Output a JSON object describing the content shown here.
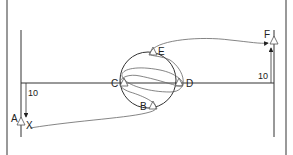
{
  "diagram": {
    "colors": {
      "line": "#333333",
      "frame": "#555555",
      "background": "#ffffff"
    },
    "frame": {
      "left_x": 7,
      "right_x": 286
    },
    "labels": {
      "A": "A",
      "B": "B",
      "C": "C",
      "D": "D",
      "E": "E",
      "F": "F",
      "X": "X"
    },
    "dimensions": {
      "left_offset": "10",
      "right_offset": "10"
    },
    "shapes": {
      "circle": {
        "cx": 148,
        "cy": 80,
        "r": 28
      },
      "baseline_y": 83,
      "left_post_x": 21,
      "right_post_x": 274
    }
  }
}
